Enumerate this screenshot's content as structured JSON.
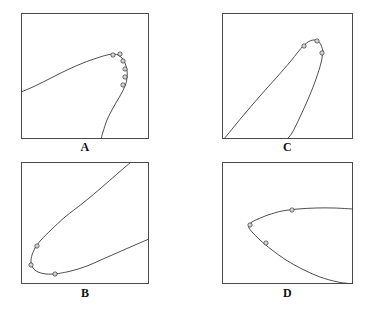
{
  "figure": {
    "background_color": "#ffffff",
    "curve_color": "#3a3a3a",
    "frame_color": "#4a4a4a",
    "marker_color": "#3a3a3a",
    "marker_fill": "#ffffff",
    "panel_count": 4
  },
  "panels": [
    {
      "id": "A",
      "label": "A",
      "position": "top-left",
      "frame": {
        "x": 21,
        "y": 13,
        "width": 128,
        "height": 126
      },
      "description": "Curve entering from the left edge rising to a rounded cusp at the upper right, then folding back down and exiting through the bottom edge",
      "chart_data": {
        "type": "line",
        "title": "A",
        "xlabel": "",
        "ylabel": "",
        "xlim": [
          0,
          128
        ],
        "ylim": [
          0,
          126
        ],
        "grid": false,
        "legend": "none",
        "series": [
          {
            "name": "upper-branch",
            "points": [
              [
                0,
                79
              ],
              [
                14,
                73
              ],
              [
                30,
                65
              ],
              [
                46,
                57
              ],
              [
                62,
                50
              ],
              [
                76,
                45
              ],
              [
                86,
                42
              ],
              [
                93,
                41
              ],
              [
                97,
                42
              ]
            ]
          },
          {
            "name": "cusp-and-lower-branch",
            "points": [
              [
                97,
                42
              ],
              [
                101,
                45
              ],
              [
                104,
                50
              ],
              [
                106,
                57
              ],
              [
                106,
                65
              ],
              [
                104,
                73
              ],
              [
                99,
                83
              ],
              [
                92,
                95
              ],
              [
                86,
                107
              ],
              [
                82,
                119
              ],
              [
                80,
                126
              ]
            ]
          }
        ],
        "markers": [
          [
            92,
            42
          ],
          [
            99,
            41
          ],
          [
            102,
            48
          ],
          [
            104,
            56
          ],
          [
            104,
            64
          ],
          [
            102,
            72
          ]
        ]
      }
    },
    {
      "id": "C",
      "label": "C",
      "position": "top-right",
      "frame": {
        "x": 222,
        "y": 13,
        "width": 131,
        "height": 126
      },
      "description": "Two nearly straight branches converging into a narrow rounded cusp near the top right; left branch descends to the bottom-left corner, right branch descends to the bottom edge",
      "chart_data": {
        "type": "line",
        "title": "C",
        "xlabel": "",
        "ylabel": "",
        "xlim": [
          0,
          131
        ],
        "ylim": [
          0,
          126
        ],
        "grid": false,
        "legend": "none",
        "series": [
          {
            "name": "left-branch",
            "points": [
              [
                2,
                126
              ],
              [
                20,
                104
              ],
              [
                38,
                83
              ],
              [
                55,
                64
              ],
              [
                68,
                49
              ],
              [
                76,
                39
              ],
              [
                81,
                33
              ]
            ]
          },
          {
            "name": "cusp",
            "points": [
              [
                81,
                33
              ],
              [
                86,
                29
              ],
              [
                91,
                27
              ],
              [
                96,
                28
              ],
              [
                99,
                32
              ],
              [
                101,
                38
              ]
            ]
          },
          {
            "name": "right-branch",
            "points": [
              [
                101,
                38
              ],
              [
                99,
                50
              ],
              [
                94,
                66
              ],
              [
                87,
                84
              ],
              [
                78,
                104
              ],
              [
                70,
                120
              ],
              [
                65,
                126
              ]
            ]
          }
        ],
        "markers": [
          [
            82,
            33
          ],
          [
            95,
            28
          ],
          [
            100,
            40
          ]
        ]
      }
    },
    {
      "id": "B",
      "label": "B",
      "position": "bottom-left",
      "frame": {
        "x": 21,
        "y": 162,
        "width": 128,
        "height": 122
      },
      "description": "Wide parabola opening to the right; the upper branch exits through the top edge, the rounded vertex sits at the lower left, and the lower branch sweeps right to exit the right edge",
      "chart_data": {
        "type": "line",
        "title": "B",
        "xlabel": "",
        "ylabel": "",
        "xlim": [
          0,
          128
        ],
        "ylim": [
          0,
          122
        ],
        "grid": false,
        "legend": "none",
        "series": [
          {
            "name": "upper-branch",
            "points": [
              [
                110,
                0
              ],
              [
                96,
                12
              ],
              [
                80,
                26
              ],
              [
                62,
                41
              ],
              [
                44,
                55
              ],
              [
                30,
                68
              ],
              [
                20,
                78
              ],
              [
                14,
                86
              ]
            ]
          },
          {
            "name": "vertex",
            "points": [
              [
                14,
                86
              ],
              [
                11,
                93
              ],
              [
                10,
                100
              ],
              [
                12,
                106
              ],
              [
                17,
                110
              ],
              [
                25,
                112
              ],
              [
                35,
                112
              ]
            ]
          },
          {
            "name": "lower-branch",
            "points": [
              [
                35,
                112
              ],
              [
                50,
                109
              ],
              [
                66,
                104
              ],
              [
                82,
                97
              ],
              [
                98,
                90
              ],
              [
                114,
                83
              ],
              [
                128,
                77
              ]
            ]
          }
        ],
        "markers": [
          [
            16,
            84
          ],
          [
            10,
            103
          ],
          [
            34,
            112
          ]
        ]
      }
    },
    {
      "id": "D",
      "label": "D",
      "position": "bottom-right",
      "frame": {
        "x": 222,
        "y": 162,
        "width": 131,
        "height": 122
      },
      "description": "Parabola opening right with a sharp vertex at the left; the upper branch runs nearly horizontally to the right edge while the lower branch descends to the bottom-right corner",
      "chart_data": {
        "type": "line",
        "title": "D",
        "xlabel": "",
        "ylabel": "",
        "xlim": [
          0,
          131
        ],
        "ylim": [
          0,
          122
        ],
        "grid": false,
        "legend": "none",
        "series": [
          {
            "name": "upper-branch",
            "points": [
              [
                131,
                47
              ],
              [
                112,
                46
              ],
              [
                94,
                46
              ],
              [
                76,
                47
              ],
              [
                60,
                49
              ],
              [
                46,
                53
              ],
              [
                36,
                57
              ]
            ]
          },
          {
            "name": "vertex",
            "points": [
              [
                36,
                57
              ],
              [
                30,
                60
              ],
              [
                27,
                63
              ],
              [
                27,
                66
              ],
              [
                30,
                70
              ]
            ]
          },
          {
            "name": "lower-branch",
            "points": [
              [
                30,
                70
              ],
              [
                38,
                78
              ],
              [
                50,
                88
              ],
              [
                64,
                98
              ],
              [
                80,
                107
              ],
              [
                98,
                115
              ],
              [
                116,
                120
              ],
              [
                131,
                122
              ]
            ]
          }
        ],
        "markers": [
          [
            70,
            48
          ],
          [
            28,
            63
          ],
          [
            44,
            81
          ]
        ]
      }
    }
  ]
}
